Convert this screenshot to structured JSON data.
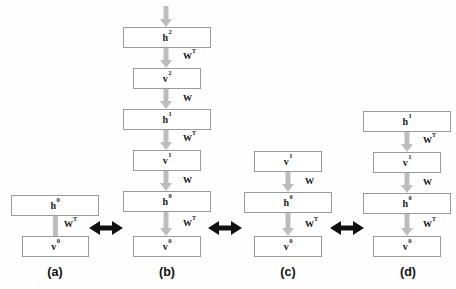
{
  "figure": {
    "background_color": "#fefefe",
    "box_border_color": "#9a9a9a",
    "arrow_color": "#bdbdbd",
    "equiv_arrow_color": "#111111"
  },
  "panels": [
    {
      "caption": "(a)",
      "nodes": [
        {
          "base": "h",
          "sup": "0",
          "type": "hidden"
        },
        {
          "base": "v",
          "sup": "0",
          "type": "visible"
        }
      ],
      "edges": [
        {
          "label_base": "W",
          "label_sup": "T",
          "arrowhead": false
        }
      ]
    },
    {
      "caption": "(b)",
      "nodes": [
        {
          "base": "h",
          "sup": "2",
          "type": "hidden"
        },
        {
          "base": "v",
          "sup": "2",
          "type": "visible"
        },
        {
          "base": "h",
          "sup": "1",
          "type": "hidden"
        },
        {
          "base": "v",
          "sup": "1",
          "type": "visible"
        },
        {
          "base": "h",
          "sup": "0",
          "type": "hidden"
        },
        {
          "base": "v",
          "sup": "0",
          "type": "visible"
        }
      ],
      "edges": [
        {
          "label_base": "W",
          "label_sup": "T",
          "arrowhead": true
        },
        {
          "label_base": "W",
          "label_sup": "",
          "arrowhead": true
        },
        {
          "label_base": "W",
          "label_sup": "T",
          "arrowhead": true
        },
        {
          "label_base": "W",
          "label_sup": "",
          "arrowhead": true
        },
        {
          "label_base": "W",
          "label_sup": "T",
          "arrowhead": true
        }
      ],
      "top_input_arrow": true
    },
    {
      "caption": "(c)",
      "nodes": [
        {
          "base": "v",
          "sup": "1",
          "type": "visible"
        },
        {
          "base": "h",
          "sup": "0",
          "type": "hidden"
        },
        {
          "base": "v",
          "sup": "0",
          "type": "visible"
        }
      ],
      "edges": [
        {
          "label_base": "W",
          "label_sup": "",
          "arrowhead": true
        },
        {
          "label_base": "W",
          "label_sup": "T",
          "arrowhead": true
        }
      ]
    },
    {
      "caption": "(d)",
      "nodes": [
        {
          "base": "h",
          "sup": "1",
          "type": "hidden"
        },
        {
          "base": "v",
          "sup": "1",
          "type": "visible"
        },
        {
          "base": "h",
          "sup": "0",
          "type": "hidden"
        },
        {
          "base": "v",
          "sup": "0",
          "type": "visible"
        }
      ],
      "edges": [
        {
          "label_base": "W",
          "label_sup": "T",
          "arrowhead": true
        },
        {
          "label_base": "W",
          "label_sup": "",
          "arrowhead": true
        },
        {
          "label_base": "W",
          "label_sup": "T",
          "arrowhead": true
        }
      ]
    }
  ],
  "equivalences": [
    {
      "between": "(a)-(b)",
      "symbol": "double-arrow"
    },
    {
      "between": "(b)-(c)",
      "symbol": "double-arrow"
    },
    {
      "between": "(c)-(d)",
      "symbol": "double-arrow"
    }
  ]
}
